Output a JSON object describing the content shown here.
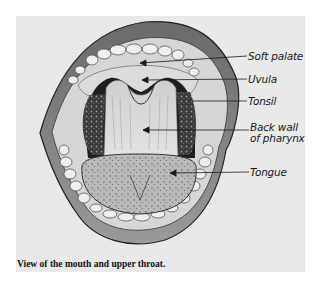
{
  "figure": {
    "caption": "View of the mouth and upper throat.",
    "labels": [
      {
        "id": "soft-palate",
        "text": "Soft palate"
      },
      {
        "id": "uvula",
        "text": "Uvula"
      },
      {
        "id": "tonsil",
        "text": "Tonsil"
      },
      {
        "id": "back-wall-line1",
        "text": "Back wall"
      },
      {
        "id": "back-wall-line2",
        "text": "of pharynx"
      },
      {
        "id": "tongue",
        "text": "Tongue"
      }
    ],
    "colors": {
      "background": "#ffffff",
      "panel": "#e9e9e9",
      "ink": "#1a1a1a"
    }
  }
}
